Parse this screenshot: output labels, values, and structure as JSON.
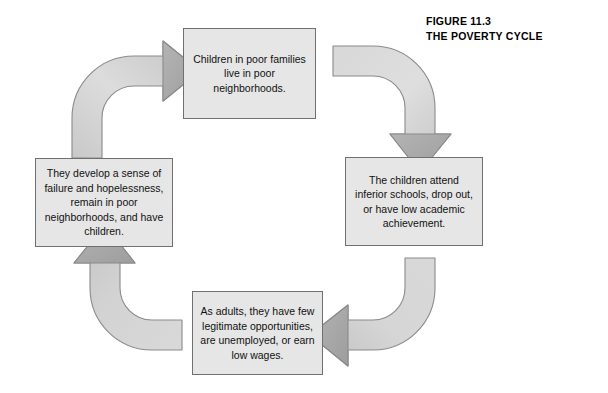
{
  "figure": {
    "number": "FIGURE 11.3",
    "title": "THE POVERTY CYCLE"
  },
  "diagram": {
    "type": "cycle",
    "direction": "clockwise",
    "node_count": 4,
    "nodes": [
      {
        "id": "poor-neighborhoods",
        "position": "top",
        "text": "Children in poor families live in poor neighborhoods."
      },
      {
        "id": "inferior-schools",
        "position": "right",
        "text": "The children attend inferior schools, drop out, or have low academic achievement."
      },
      {
        "id": "few-opportunities",
        "position": "bottom",
        "text": "As adults, they have few legitimate opportunities, are unemployed, or earn low wages."
      },
      {
        "id": "sense-of-failure",
        "position": "left",
        "text": "They develop a sense of failure and hopelessness, remain in poor neighborhoods, and have children."
      }
    ],
    "arrows": [
      {
        "id": "arrow-left-to-top",
        "from": "sense-of-failure",
        "to": "poor-neighborhoods",
        "shape": "curved-quarter",
        "name": "arrow-bottom-left-to-top"
      },
      {
        "id": "arrow-top-to-right",
        "from": "poor-neighborhoods",
        "to": "inferior-schools",
        "shape": "curved-quarter",
        "name": "arrow-top-to-right"
      },
      {
        "id": "arrow-right-to-bottom",
        "from": "inferior-schools",
        "to": "few-opportunities",
        "shape": "curved-quarter",
        "name": "arrow-right-to-bottom"
      },
      {
        "id": "arrow-bottom-to-left",
        "from": "few-opportunities",
        "to": "sense-of-failure",
        "shape": "curved-quarter",
        "name": "arrow-bottom-to-left"
      }
    ]
  },
  "colors": {
    "background": "#ffffff",
    "box_fill": "#e6e6e6",
    "box_border": "#707070",
    "arrow_body": "#d4d4d4",
    "arrow_head": "#a8a8a8",
    "arrow_outline": "#8a8a8a",
    "text": "#111111",
    "caption_text": "#000000"
  }
}
